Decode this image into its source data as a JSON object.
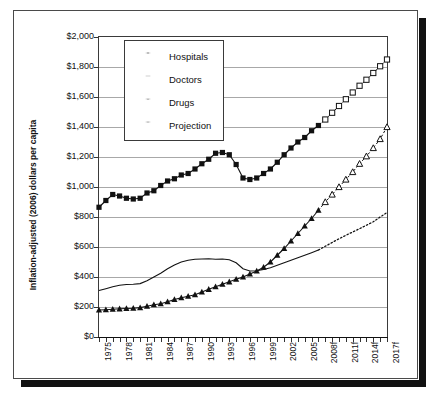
{
  "chart_data": {
    "type": "line",
    "title": "",
    "xlabel": "",
    "ylabel": "Inflation-adjusted (2006) dollars per capita",
    "ylim": [
      0,
      2000
    ],
    "ytick_values": [
      0,
      200,
      400,
      600,
      800,
      1000,
      1200,
      1400,
      1600,
      1800,
      2000
    ],
    "ytick_labels": [
      "$0",
      "$200",
      "$400",
      "$600",
      "$800",
      "$1,000",
      "$1,200",
      "$1,400",
      "$1,600",
      "$1,800",
      "$2,000"
    ],
    "grid": true,
    "legend_position": "upper left",
    "x": [
      1975,
      1976,
      1977,
      1978,
      1979,
      1980,
      1981,
      1982,
      1983,
      1984,
      1985,
      1986,
      1987,
      1988,
      1989,
      1990,
      1991,
      1992,
      1993,
      1994,
      1995,
      1996,
      1997,
      1998,
      1999,
      2000,
      2001,
      2002,
      2003,
      2004,
      2005,
      2006,
      2007,
      2008,
      2009,
      2010,
      2011,
      2012,
      2013,
      2014,
      2015,
      2016,
      2017
    ],
    "xtick_labels": [
      "1975",
      "1978",
      "1981",
      "1984",
      "1987",
      "1990",
      "1993",
      "1996",
      "1999",
      "2002",
      "2005",
      "2008f",
      "2011f",
      "2014f",
      "2017f"
    ],
    "xtick_years": [
      1975,
      1978,
      1981,
      1984,
      1987,
      1990,
      1993,
      1996,
      1999,
      2002,
      2005,
      2008,
      2011,
      2014,
      2017
    ],
    "forecast_start_year": 2007,
    "series": [
      {
        "name": "Hospitals",
        "marker": "filled-square",
        "projection_marker": "open-square",
        "values": [
          865,
          910,
          950,
          940,
          925,
          920,
          925,
          960,
          975,
          1010,
          1040,
          1055,
          1080,
          1090,
          1120,
          1155,
          1185,
          1225,
          1230,
          1215,
          1150,
          1060,
          1050,
          1060,
          1090,
          1120,
          1165,
          1215,
          1260,
          1300,
          1330,
          1375,
          1410,
          1450,
          1495,
          1540,
          1585,
          1630,
          1675,
          1715,
          1760,
          1805,
          1850
        ]
      },
      {
        "name": "Doctors",
        "marker": "none",
        "projection_marker": "dotted",
        "values": [
          310,
          322,
          335,
          345,
          350,
          352,
          356,
          375,
          400,
          425,
          455,
          480,
          500,
          512,
          518,
          520,
          522,
          518,
          520,
          515,
          495,
          455,
          440,
          442,
          450,
          462,
          478,
          495,
          512,
          528,
          545,
          562,
          580,
          605,
          630,
          655,
          678,
          700,
          722,
          745,
          768,
          800,
          830
        ]
      },
      {
        "name": "Drugs",
        "marker": "filled-triangle",
        "projection_marker": "open-triangle",
        "values": [
          180,
          182,
          185,
          188,
          190,
          192,
          196,
          205,
          215,
          222,
          235,
          250,
          262,
          272,
          282,
          300,
          318,
          335,
          352,
          368,
          385,
          400,
          420,
          440,
          465,
          500,
          545,
          590,
          640,
          690,
          740,
          790,
          845,
          900,
          950,
          1000,
          1050,
          1100,
          1155,
          1205,
          1260,
          1320,
          1400
        ]
      }
    ],
    "legend": [
      {
        "label": "Hospitals",
        "marker": "filled-square"
      },
      {
        "label": "Doctors",
        "marker": "line"
      },
      {
        "label": "Drugs",
        "marker": "filled-triangle"
      },
      {
        "label": "Projection",
        "marker": "open-triangle"
      }
    ],
    "colors": {
      "series_line": "#111111",
      "gridline": "#a8a8a8",
      "axis": "#333333",
      "background": "#ffffff"
    }
  }
}
